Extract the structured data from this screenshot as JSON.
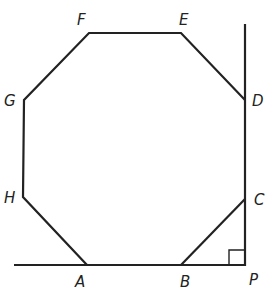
{
  "diagram": {
    "vertices": {
      "A": {
        "label": "A",
        "x": 87,
        "y": 265
      },
      "B": {
        "label": "B",
        "x": 181,
        "y": 265
      },
      "C": {
        "label": "C",
        "x": 245,
        "y": 199
      },
      "D": {
        "label": "D",
        "x": 245,
        "y": 100
      },
      "E": {
        "label": "E",
        "x": 181,
        "y": 33
      },
      "F": {
        "label": "F",
        "x": 89,
        "y": 33
      },
      "G": {
        "label": "G",
        "x": 24,
        "y": 100
      },
      "H": {
        "label": "H",
        "x": 23,
        "y": 197
      }
    },
    "point_P": {
      "label": "P",
      "x": 245,
      "y": 265
    },
    "right_angle_at": "P",
    "labels": {
      "A": "A",
      "B": "B",
      "C": "C",
      "D": "D",
      "E": "E",
      "F": "F",
      "G": "G",
      "H": "H",
      "P": "P"
    }
  }
}
